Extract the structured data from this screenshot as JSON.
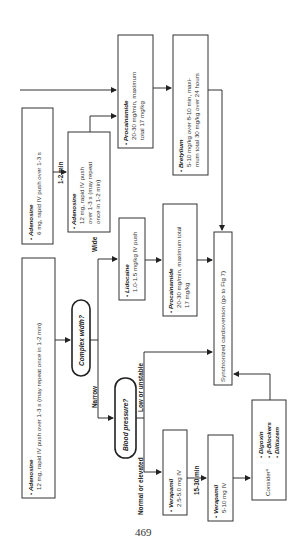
{
  "page_number": "469",
  "flowchart": {
    "orientation": "rotated 90 degrees counter-clockwise",
    "nodes": {
      "adenosine_6": {
        "drug": "Adenosine",
        "lines": [
          "6 mg, rapid IV push over 1-3 s"
        ]
      },
      "adenosine_12_first": {
        "drug": "Adenosine",
        "lines": [
          "12 mg, rapid IV push",
          "over 1-3 s (may repeat",
          "once in 1-2 min)"
        ]
      },
      "procainamide_top": {
        "drug": "Procainamide",
        "lines": [
          "20-30 mg/min, maximum",
          "total 17 mg/kg"
        ]
      },
      "bretylium": {
        "drug": "Bretylium",
        "lines": [
          "5-10 mg/kg over 8-10 min, maxi-",
          "mum total 30 mg/kg over 24 hours"
        ]
      },
      "adenosine_12_second": {
        "drug": "Adenosine",
        "lines": [
          "12 mg, rapid IV push over 1-3 s (may repeat once in 1-2 min)"
        ]
      },
      "complex_width": {
        "label": "Complex width?"
      },
      "blood_pressure": {
        "label": "Blood pressure?"
      },
      "lidocaine": {
        "drug": "Lidocaine",
        "lines": [
          "1.0-1.5 mg/kg IV push"
        ]
      },
      "procainamide_mid": {
        "drug": "Procainamide",
        "lines": [
          "20-30 mg/min, maximum total",
          "17 mg/kg"
        ]
      },
      "cardioversion": {
        "label": "Synchronized cardioversion (go to Fig 7)"
      },
      "verapamil_first": {
        "drug": "Verapamil",
        "lines": [
          "2.5-5.0 mg IV"
        ]
      },
      "verapamil_second": {
        "drug": "Verapamil",
        "lines": [
          "5-10 mg IV"
        ]
      },
      "consider": {
        "label": "Consider",
        "footnote": "a",
        "items": [
          "Digoxin",
          "β-Blockers",
          "Diltiazem"
        ]
      }
    },
    "edge_labels": {
      "one_to_two_min": "1-2 min",
      "wide": "Wide",
      "narrow": "Narrow",
      "low_or_unstable": "Low or unstable",
      "normal_or_elevated": "Normal or elevated",
      "fifteen_to_thirty_min": "15-30 min"
    },
    "bullet": "•"
  }
}
